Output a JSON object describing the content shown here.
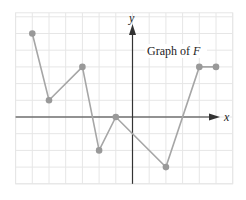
{
  "chart_data": {
    "type": "line",
    "title": "",
    "annotation": "Graph of F",
    "function_name": "F",
    "xlabel": "x",
    "ylabel": "y",
    "x": [
      -6,
      -5,
      -3,
      -2,
      -1,
      2,
      4,
      5
    ],
    "y": [
      5,
      1,
      3,
      -2,
      0,
      -3,
      3,
      3
    ],
    "points": [
      [
        -6,
        5
      ],
      [
        -5,
        1
      ],
      [
        -3,
        3
      ],
      [
        -2,
        -2
      ],
      [
        -1,
        0
      ],
      [
        2,
        -3
      ],
      [
        4,
        3
      ],
      [
        5,
        3
      ]
    ],
    "xlim": [
      -7,
      6
    ],
    "ylim": [
      -4,
      6
    ],
    "grid": true,
    "tick_labels": false,
    "legend": "none"
  },
  "labels": {
    "annotation": "Graph of F",
    "annotation_prefix": "Graph of ",
    "annotation_var": "F",
    "x_axis": "x",
    "y_axis": "y"
  },
  "colors": {
    "grid": "#e6e6e6",
    "axis": "#333333",
    "line": "#a6a6a6",
    "point": "#999999",
    "text": "#222222"
  }
}
